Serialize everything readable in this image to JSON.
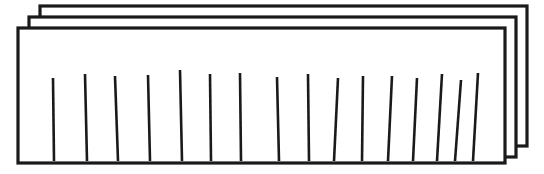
{
  "figure": {
    "canvas": {
      "width": 544,
      "height": 174,
      "background": "#ffffff"
    },
    "stroke_color": "#1a1a1a",
    "fill_color": "#ffffff",
    "sheet_stroke_width": 3.2,
    "line_stroke_width": 2.6,
    "sheets": [
      {
        "name": "back-sheet",
        "x": 40,
        "y": 6,
        "width": 487,
        "height": 140,
        "z": 1
      },
      {
        "name": "middle-sheet",
        "x": 29,
        "y": 17,
        "width": 487,
        "height": 140,
        "z": 2
      },
      {
        "name": "front-sheet",
        "x": 18,
        "y": 28,
        "width": 487,
        "height": 135,
        "z": 3
      }
    ],
    "tally_lines": {
      "count": 16,
      "description": "Near-vertical hand-drawn strokes inside the front sheet",
      "strokes": [
        {
          "index": 1,
          "x1": 53,
          "y1": 78,
          "x2": 54,
          "y2": 161
        },
        {
          "index": 2,
          "x1": 85,
          "y1": 74,
          "x2": 87,
          "y2": 161
        },
        {
          "index": 3,
          "x1": 115,
          "y1": 76,
          "x2": 118,
          "y2": 161
        },
        {
          "index": 4,
          "x1": 148,
          "y1": 75,
          "x2": 150,
          "y2": 161
        },
        {
          "index": 5,
          "x1": 180,
          "y1": 70,
          "x2": 182,
          "y2": 161
        },
        {
          "index": 6,
          "x1": 210,
          "y1": 74,
          "x2": 211,
          "y2": 161
        },
        {
          "index": 7,
          "x1": 240,
          "y1": 73,
          "x2": 241,
          "y2": 161
        },
        {
          "index": 8,
          "x1": 277,
          "y1": 77,
          "x2": 279,
          "y2": 161
        },
        {
          "index": 9,
          "x1": 308,
          "y1": 74,
          "x2": 309,
          "y2": 161
        },
        {
          "index": 10,
          "x1": 338,
          "y1": 78,
          "x2": 334,
          "y2": 161
        },
        {
          "index": 11,
          "x1": 363,
          "y1": 76,
          "x2": 362,
          "y2": 161
        },
        {
          "index": 12,
          "x1": 392,
          "y1": 76,
          "x2": 388,
          "y2": 161
        },
        {
          "index": 13,
          "x1": 417,
          "y1": 78,
          "x2": 413,
          "y2": 161
        },
        {
          "index": 14,
          "x1": 442,
          "y1": 74,
          "x2": 437,
          "y2": 161
        },
        {
          "index": 15,
          "x1": 461,
          "y1": 80,
          "x2": 455,
          "y2": 161
        },
        {
          "index": 16,
          "x1": 478,
          "y1": 73,
          "x2": 473,
          "y2": 161
        }
      ]
    }
  }
}
